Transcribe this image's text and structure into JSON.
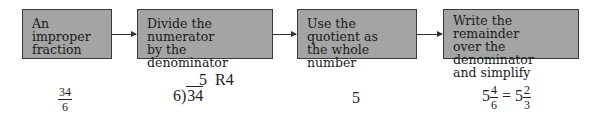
{
  "boxes": [
    {
      "label": "An improper\nfraction"
    },
    {
      "label": "Divide the numerator\nby the denominator"
    },
    {
      "label": "Use the quotient as\nthe whole number"
    },
    {
      "label": "Write the remainder\nover the denominator\nand simplify"
    }
  ],
  "examples": {
    "fraction": {
      "numerator": "34",
      "denominator": "6"
    },
    "division": {
      "quotient": "5",
      "remainder": "R4",
      "divisor": "6",
      "dividend": "34"
    },
    "whole": "5",
    "result": {
      "whole": "5",
      "numerator": "4",
      "denominator": "6",
      "equals": "=",
      "simplified_whole": "5",
      "simplified_numerator": "2",
      "simplified_denominator": "3"
    }
  },
  "colors": {
    "box_fill": "#a4a4a4",
    "box_border": "#3a3a3a"
  }
}
